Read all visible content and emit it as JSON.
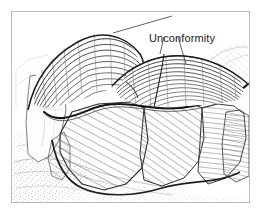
{
  "figure": {
    "kind": "geologic-block-diagram",
    "style": "pen-and-ink line drawing",
    "frame_color": "#b9b9b9",
    "background_color": "#ffffff",
    "ink_color": "#3a3a3a",
    "heavy_ink_color": "#1a1a1a",
    "light_ink_color": "#9a9a9a"
  },
  "annotations": {
    "unconformity": {
      "label": "Unconformity",
      "color": "#1c1c1c",
      "leader_count": 2
    }
  },
  "geology": {
    "upper_unit": {
      "name": "horizontally bedded strata",
      "description": "younger flat-lying layers forming the cap and ridge crest",
      "bed_count": 12
    },
    "lower_unit": {
      "name": "tilted and folded beds",
      "description": "older steeply inclined strata truncated beneath the contact",
      "hatch_angles_deg": [
        62,
        72,
        84,
        55
      ]
    },
    "contact": {
      "name": "angular unconformity surface",
      "description": "bold dark line separating flat-lying beds above from truncated tilted beds below"
    },
    "foreground": {
      "name": "stippled alluvial plain",
      "description": "dotted valley floor in the lower left with faint contour lines"
    },
    "background": {
      "name": "distant hills",
      "description": "faint hachured slopes along the right horizon"
    },
    "cliff": {
      "name": "light cliff face",
      "description": "pale un-hatched escarpment on the left flank"
    }
  }
}
